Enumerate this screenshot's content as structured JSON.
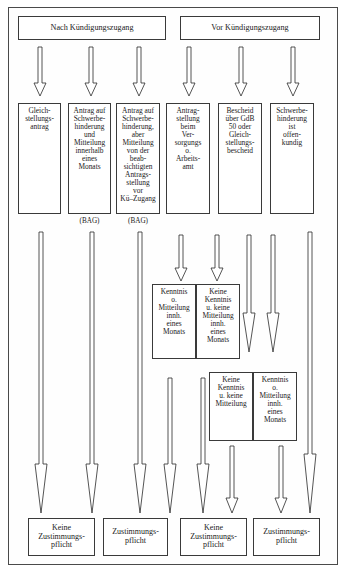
{
  "diagram": {
    "title_present": false,
    "headers": [
      {
        "id": "h1",
        "label": "Nach Kündigungszugang"
      },
      {
        "id": "h2",
        "label": "Vor Kündigungszugang"
      }
    ],
    "stage1_boxes": [
      {
        "id": "s1",
        "label": "Gleich-\nstellungs-\nantrag"
      },
      {
        "id": "s2",
        "label": "Antrag auf\nSchwerbe-\nhinderung\nund\nMitteilung\ninnerhalb\neines\nMonats"
      },
      {
        "id": "s3",
        "label": "Antrag auf\nSchwerbe-\nhinderung,\naber\nMitteilung\nvon der\nbeab-\nsichtigten\nAntrags-\nstellung\nvor\nKü–Zugang"
      },
      {
        "id": "s4",
        "label": "Antrag-\nstellung\nbeim\nVer-\nsorgungs\no.\nArbeits-\namt"
      },
      {
        "id": "s5",
        "label": "Bescheid\nüber GdB\n50 oder\nGleich-\nstellungs-\nbescheid"
      },
      {
        "id": "s6",
        "label": "Schwerbe-\nhinderung\nist\noffen-\nkundig"
      }
    ],
    "annotations": [
      {
        "id": "bag1",
        "label": "(BAG)"
      },
      {
        "id": "bag2",
        "label": "(BAG)"
      }
    ],
    "stage2_boxes": [
      {
        "id": "m1",
        "label": "Kenntnis\no.\nMitteilung\ninnh.\neines\nMonats"
      },
      {
        "id": "m2",
        "label": "Keine\nKenntnis\nu. keine\nMitteilung\ninnh.\neines\nMonats"
      }
    ],
    "stage3_boxes": [
      {
        "id": "m3",
        "label": "Keine\nKenntnis\nu. keine\nMitteilung"
      },
      {
        "id": "m4",
        "label": "Kenntnis\no.\nMitteilung\ninnh.\neines\nMonats"
      }
    ],
    "outcome_boxes": [
      {
        "id": "o1",
        "label": "Keine\nZustimmungs-\npflicht"
      },
      {
        "id": "o2",
        "label": "Zustimmungs-\npflicht"
      },
      {
        "id": "o3",
        "label": "Keine\nZustimmungs-\npflicht"
      },
      {
        "id": "o4",
        "label": "Zustimmungs-\npflicht"
      }
    ],
    "colors": {
      "frame_border": "#4a4a4a",
      "box_border": "#3a3a3a",
      "text": "#1a1a1a",
      "background": "#ffffff",
      "arrow_stroke": "#2a2a2a"
    },
    "arrow_count": 20
  }
}
